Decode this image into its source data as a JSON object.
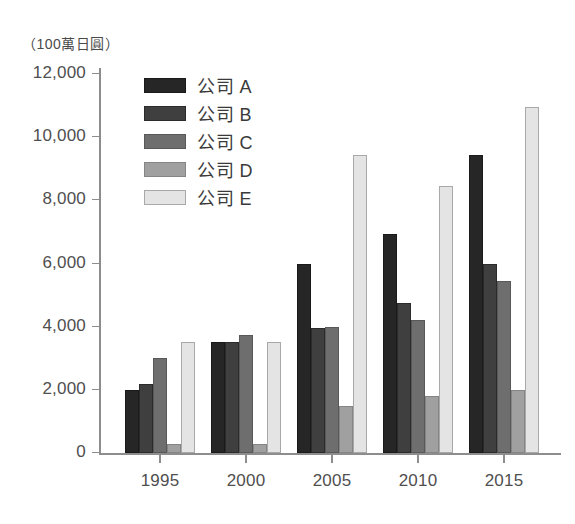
{
  "chart_data": {
    "type": "bar",
    "title": "",
    "unit_label": "（100萬日圓）",
    "xlabel": "",
    "ylabel": "",
    "categories": [
      "1995",
      "2000",
      "2005",
      "2010",
      "2015"
    ],
    "ylim": [
      0,
      12000
    ],
    "ytick_labels": [
      "12,000",
      "10,000",
      "8,000",
      "6,000",
      "4,000",
      "2,000",
      "0"
    ],
    "ytick_values": [
      12000,
      10000,
      8000,
      6000,
      4000,
      2000,
      0
    ],
    "grid": false,
    "legend_position": "top-left-inside",
    "series": [
      {
        "name": "公司 A",
        "color": "#262626",
        "values": [
          2000,
          3500,
          6000,
          6950,
          9450
        ]
      },
      {
        "name": "公司 B",
        "color": "#3f3f3f",
        "values": [
          2200,
          3500,
          3950,
          4750,
          6000
        ]
      },
      {
        "name": "公司 C",
        "color": "#6e6e6e",
        "values": [
          3000,
          3750,
          4000,
          4200,
          5450
        ]
      },
      {
        "name": "公司 D",
        "color": "#a0a0a0",
        "values": [
          300,
          300,
          1500,
          1800,
          2000
        ]
      },
      {
        "name": "公司 E",
        "color": "#e4e4e4",
        "values": [
          3500,
          3500,
          9450,
          8450,
          10950
        ]
      }
    ]
  }
}
